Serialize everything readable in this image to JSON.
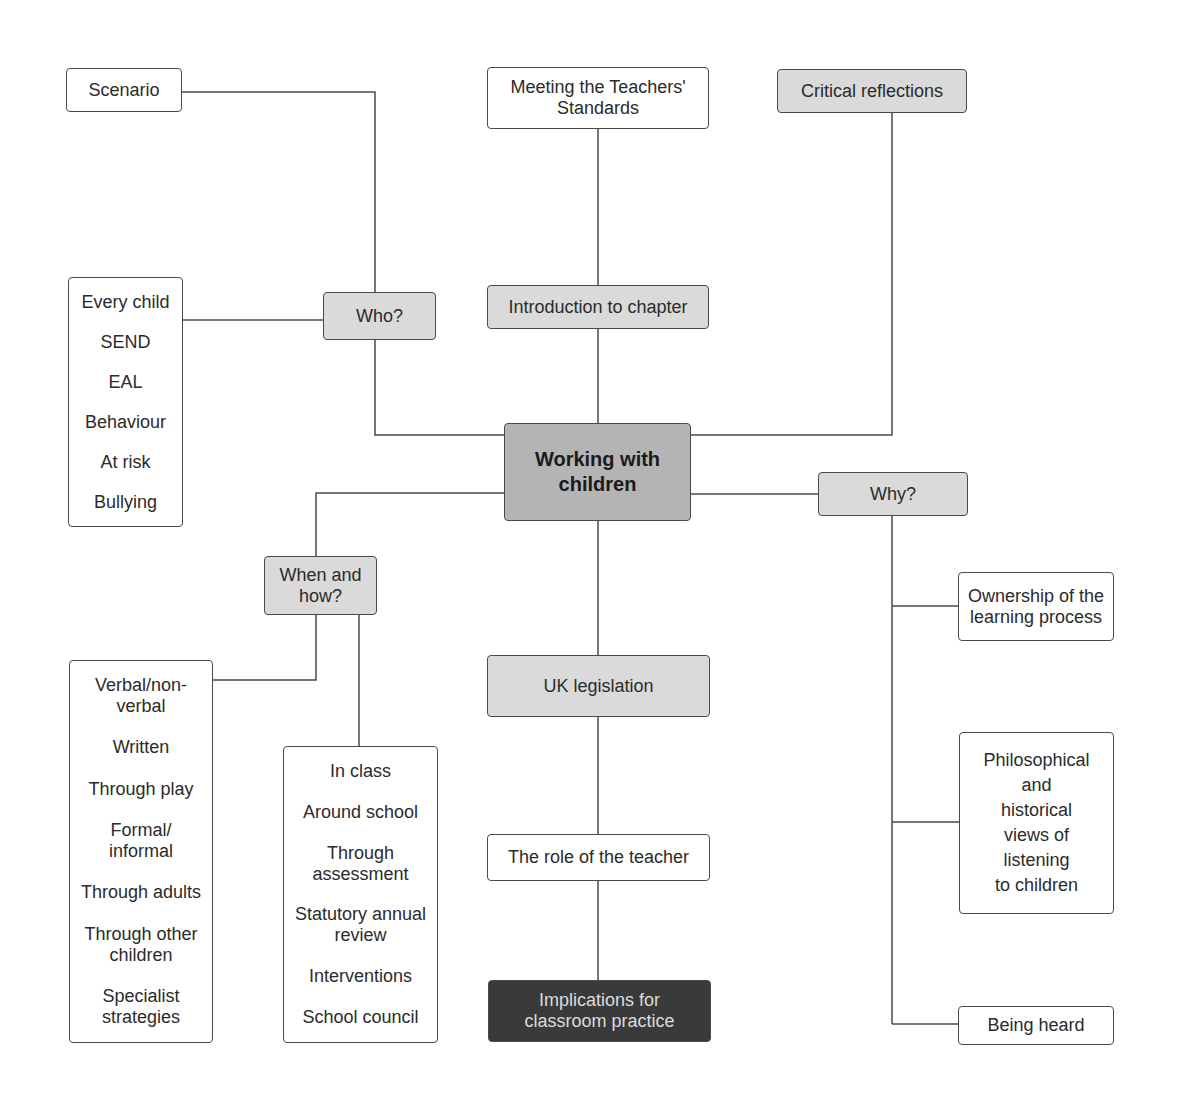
{
  "diagram": {
    "title": "Working with children",
    "colors": {
      "line": "#4a4a4a",
      "white_box": "#ffffff",
      "grey_box": "#dadada",
      "center_box": "#b4b4b4",
      "dark_box": "#3a3a3a",
      "dark_box_text": "#dcdcdc"
    },
    "nodes": {
      "center": {
        "label": "Working with\nchildren"
      },
      "scenario": {
        "label": "Scenario"
      },
      "meeting_standards": {
        "label": "Meeting the Teachers'\nStandards"
      },
      "critical_reflections": {
        "label": "Critical reflections"
      },
      "introduction": {
        "label": "Introduction to chapter"
      },
      "who": {
        "label": "Who?"
      },
      "why": {
        "label": "Why?"
      },
      "when_how": {
        "label": "When and\nhow?"
      },
      "uk_legislation": {
        "label": "UK legislation"
      },
      "role_of_teacher": {
        "label": "The role of the teacher"
      },
      "implications": {
        "label": "Implications for\nclassroom practice"
      },
      "ownership": {
        "label": "Ownership of the\nlearning process"
      },
      "philosophical": {
        "label": "Philosophical\nand\nhistorical\nviews of\nlistening\nto children"
      },
      "being_heard": {
        "label": "Being heard"
      }
    },
    "who_list": {
      "items": [
        "Every child",
        "SEND",
        "EAL",
        "Behaviour",
        "At risk",
        "Bullying"
      ]
    },
    "how_list": {
      "items": [
        "Verbal/non-\nverbal",
        "Written",
        "Through play",
        "Formal/\ninformal",
        "Through adults",
        "Through other\nchildren",
        "Specialist\nstrategies"
      ]
    },
    "when_list": {
      "items": [
        "In class",
        "Around school",
        "Through\nassessment",
        "Statutory annual\nreview",
        "Interventions",
        "School council"
      ]
    }
  }
}
